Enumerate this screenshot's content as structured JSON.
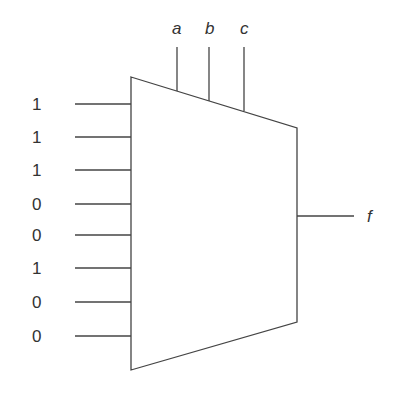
{
  "diagram": {
    "type": "multiplexer",
    "select_inputs": [
      {
        "label": "a",
        "x": 177,
        "y_label": 20
      },
      {
        "label": "b",
        "x": 209,
        "y_label": 20
      },
      {
        "label": "c",
        "x": 244,
        "y_label": 20
      }
    ],
    "data_inputs": [
      {
        "value": "1",
        "y": 104
      },
      {
        "value": "1",
        "y": 137
      },
      {
        "value": "1",
        "y": 170
      },
      {
        "value": "0",
        "y": 204
      },
      {
        "value": "0",
        "y": 235
      },
      {
        "value": "1",
        "y": 268
      },
      {
        "value": "0",
        "y": 302
      },
      {
        "value": "0",
        "y": 336
      }
    ],
    "output": {
      "label": "f",
      "y": 216
    },
    "line_color": "#444444"
  }
}
